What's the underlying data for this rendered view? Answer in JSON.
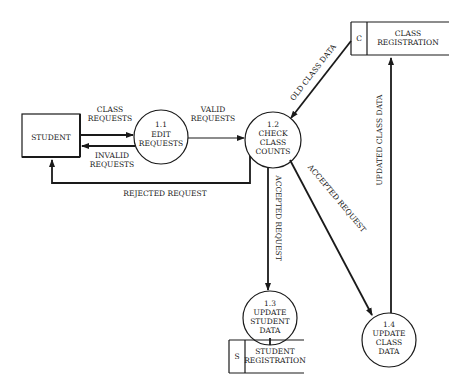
{
  "diagram": {
    "type": "data-flow-diagram",
    "entities": [
      {
        "id": "student",
        "label": "STUDENT"
      }
    ],
    "processes": [
      {
        "id": "p11",
        "number": "1.1",
        "lines": [
          "EDIT",
          "REQUESTS"
        ]
      },
      {
        "id": "p12",
        "number": "1.2",
        "lines": [
          "CHECK",
          "CLASS",
          "COUNTS"
        ]
      },
      {
        "id": "p13",
        "number": "1.3",
        "lines": [
          "UPDATE",
          "STUDENT",
          "DATA"
        ]
      },
      {
        "id": "p14",
        "number": "1.4",
        "lines": [
          "UPDATE",
          "CLASS",
          "DATA"
        ]
      }
    ],
    "data_stores": [
      {
        "id": "C",
        "code": "C",
        "lines": [
          "CLASS",
          "REGISTRATION"
        ]
      },
      {
        "id": "S",
        "code": "S",
        "lines": [
          "STUDENT",
          "REGISTRATION"
        ]
      }
    ],
    "flows": [
      {
        "from": "student",
        "to": "p11",
        "lines": [
          "CLASS",
          "REQUESTS"
        ]
      },
      {
        "from": "p11",
        "to": "student",
        "lines": [
          "INVALID",
          "REQUESTS"
        ]
      },
      {
        "from": "p11",
        "to": "p12",
        "lines": [
          "VALID",
          "REQUESTS"
        ]
      },
      {
        "from": "p12",
        "to": "student",
        "label": "REJECTED REQUEST"
      },
      {
        "from": "C",
        "to": "p12",
        "label": "OLD CLASS DATA"
      },
      {
        "from": "p12",
        "to": "p13",
        "label": "ACCEPTED REQUEST"
      },
      {
        "from": "p12",
        "to": "p14",
        "label": "ACCEPTED REQUEST"
      },
      {
        "from": "p14",
        "to": "C",
        "label": "UPDATED CLASS DATA"
      },
      {
        "from": "p13",
        "to": "S",
        "label": ""
      }
    ]
  }
}
